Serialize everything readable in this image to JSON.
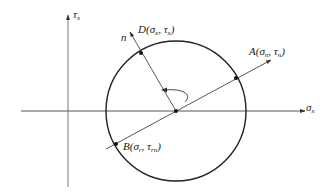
{
  "diagram": {
    "type": "mohr-circle",
    "axes": {
      "horizontal": {
        "symbol": "σ",
        "subscript": "x"
      },
      "vertical": {
        "symbol": "τ",
        "subscript": "x"
      }
    },
    "points": {
      "D": {
        "name": "D",
        "open": "(",
        "s1": "σ",
        "s1sub": "x",
        "sep": ", ",
        "s2": "τ",
        "s2sub": "x",
        "close": ")"
      },
      "A": {
        "name": "A",
        "open": "(",
        "s1": "σ",
        "s1sub": "n",
        "sep": ", ",
        "s2": "τ",
        "s2sub": "n",
        "close": ")"
      },
      "B": {
        "name": "B",
        "open": "(",
        "s1": "σ",
        "s1sub": "r",
        "sep": ", ",
        "s2": "τ",
        "s2sub": "rn",
        "close": ")"
      }
    },
    "normal_label": "n"
  }
}
